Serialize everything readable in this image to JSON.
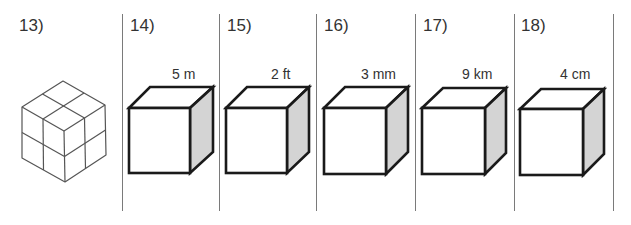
{
  "worksheet": {
    "problems": [
      {
        "number": "13)",
        "figure": "isometric-2x2x2-cube"
      },
      {
        "number": "14)",
        "figure": "cube",
        "edge_label": "5 m"
      },
      {
        "number": "15)",
        "figure": "cube",
        "edge_label": "2 ft"
      },
      {
        "number": "16)",
        "figure": "cube",
        "edge_label": "3 mm"
      },
      {
        "number": "17)",
        "figure": "cube",
        "edge_label": "9 km"
      },
      {
        "number": "18)",
        "figure": "cube",
        "edge_label": "4 cm"
      }
    ]
  },
  "colors": {
    "cube_outline": "#1a1a1a",
    "cube_side_face": "#d4d4d4",
    "iso_lines": "#555555",
    "divider": "#7a7a7a"
  }
}
